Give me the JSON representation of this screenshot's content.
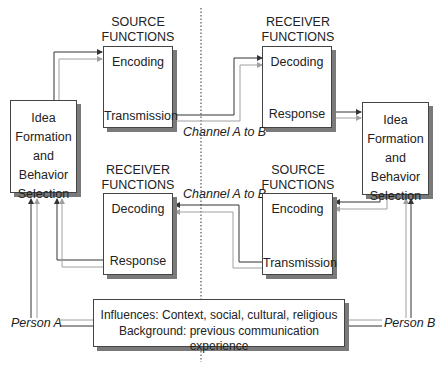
{
  "diagram": {
    "person_a": {
      "label": "Person A",
      "idea_box": {
        "lines": [
          "Idea",
          "Formation",
          "and",
          "Behavior",
          "Selection"
        ]
      },
      "source": {
        "header_line1": "SOURCE",
        "header_line2": "FUNCTIONS",
        "top": "Encoding",
        "bottom": "Transmission"
      },
      "receiver": {
        "header_line1": "RECEIVER",
        "header_line2": "FUNCTIONS",
        "top": "Decoding",
        "bottom": "Response"
      }
    },
    "person_b": {
      "label": "Person B",
      "idea_box": {
        "lines": [
          "Idea",
          "Formation",
          "and",
          "Behavior",
          "Selection"
        ]
      },
      "receiver": {
        "header_line1": "RECEIVER",
        "header_line2": "FUNCTIONS",
        "top": "Decoding",
        "bottom": "Response"
      },
      "source": {
        "header_line1": "SOURCE",
        "header_line2": "FUNCTIONS",
        "top": "Encoding",
        "bottom": "Transmission"
      }
    },
    "channels": {
      "upper": "Channel A to B",
      "lower": "Channel A to B"
    },
    "influences": {
      "line1": "Influences: Context, social, cultural, religious",
      "line2": "Background: previous communication experience"
    },
    "colors": {
      "dark_line": "#333333",
      "light_line": "#a0a0a0",
      "shadow": "#7a7a7a",
      "border": "#444444"
    }
  }
}
